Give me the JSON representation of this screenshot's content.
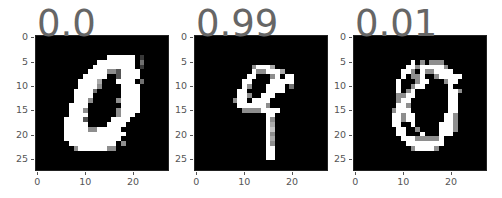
{
  "chart_data": {
    "type": "heatmap",
    "panels": [
      {
        "title": "0.0",
        "digit_shown": "0"
      },
      {
        "title": "0.99",
        "digit_shown": "9"
      },
      {
        "title": "0.01",
        "digit_shown": "0"
      }
    ],
    "xticks": [
      "0",
      "10",
      "20"
    ],
    "yticks": [
      "0",
      "5",
      "10",
      "15",
      "20",
      "25"
    ],
    "xlim": [
      0,
      27
    ],
    "ylim": [
      27,
      0
    ],
    "colormap": "gray",
    "title_color": "#666666"
  },
  "panels": [
    {
      "title": "0.0",
      "left": 35,
      "grid": [
        "............................",
        "............................",
        "............................",
        "............................",
        "...............999999.2.....",
        ".............99999999.4.....",
        "............999999999.2.....",
        "...........99995539999......",
        "..........999990039999......",
        ".........999960009999.4.....",
        ".........9999500009999......",
        "........99994000009999......",
        "........99990000009999......",
        "........99950000059999......",
        ".......999900000009999......",
        ".......999500000059999......",
        ".......99990000005999.......",
        "......99993000009999........",
        "......9999900009999.........",
        "......999995599999..........",
        "......9999999999999.........",
        "......999999999999..........",
        ".......9999999999.5.........",
        "........599999955...........",
        "............................",
        "............................",
        "............................",
        "............................"
      ]
    },
    {
      "title": "0.99",
      "left": 194,
      "grid": [
        "............................",
        "............................",
        "............................",
        "............................",
        "............................",
        "............................",
        "............59996...........",
        "............9559996..........",
        "...........9900059.99.......",
        "..........99000099999.......",
        "..........950009999.4.......",
        ".........9900009999.........",
        ".........99500999...........",
        "........59909999............",
        ".........9999995............",
        "..........55559999..........",
        "...............99...........",
        "...............95...........",
        "...............96...........",
        "...............97...........",
        "...............95...........",
        "...............96...........",
        "...............95...........",
        "...............99...........",
        "...............99...........",
        "...............99...........",
        "............................",
        "............................"
      ]
    },
    {
      "title": "0.01",
      "left": 353,
      "grid": [
        "............................",
        "............................",
        "............................",
        "............................",
        "............................",
        "............9.5.555.........",
        "...........995999995........",
        "..........99509559999.......",
        "..........9055900599999.....",
        ".........9000599000599......",
        ".........900599000009.......",
        ".........90590000000995.....",
        ".........5599000000099......",
        ".........5990000000099......",
        ".........9950000000099......",
        "........59990000000099......",
        "........99599000000995......",
        "........99599000000995......",
        "........99009000009995......",
        ".........9900500009995......",
        ".........990009000999.......",
        "..........999555559.........",
        "...........99999999.........",
        "............599995..........",
        "............................",
        "............................",
        "............................",
        "............................"
      ]
    }
  ],
  "axes": {
    "yticks": [
      {
        "label": "0",
        "value": 0
      },
      {
        "label": "5",
        "value": 5
      },
      {
        "label": "10",
        "value": 10
      },
      {
        "label": "15",
        "value": 15
      },
      {
        "label": "20",
        "value": 20
      },
      {
        "label": "25",
        "value": 25
      }
    ],
    "xticks": [
      {
        "label": "0",
        "value": 0
      },
      {
        "label": "10",
        "value": 10
      },
      {
        "label": "20",
        "value": 20
      }
    ]
  }
}
